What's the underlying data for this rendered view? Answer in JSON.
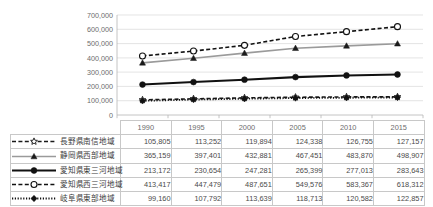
{
  "chart_data": {
    "type": "line",
    "title": "",
    "subtitle": "",
    "xlabel": "",
    "ylabel": "",
    "categories": [
      "1990",
      "1995",
      "2000",
      "2005",
      "2010",
      "2015"
    ],
    "ylim": [
      0,
      700000
    ],
    "yticks": [
      0,
      100000,
      200000,
      300000,
      400000,
      500000,
      600000,
      700000
    ],
    "ytick_labels": [
      "0",
      "100,000",
      "200,000",
      "300,000",
      "400,000",
      "500,000",
      "600,000",
      "700,000"
    ],
    "grid": "horizontal",
    "legend_position": "table-left",
    "series": [
      {
        "name": "長野県南信地域",
        "marker": "open-star",
        "line_style": "dashed",
        "color": "#1a1a1a",
        "values": [
          105805,
          113252,
          119894,
          124338,
          126755,
          127157
        ],
        "display_values": [
          "105,805",
          "113,252",
          "119,894",
          "124,338",
          "126,755",
          "127,157"
        ]
      },
      {
        "name": "静岡県西部地域",
        "marker": "filled-triangle",
        "line_style": "solid",
        "color": "#9a9a9a",
        "values": [
          365159,
          397401,
          432881,
          467451,
          483870,
          498907
        ],
        "display_values": [
          "365,159",
          "397,401",
          "432,881",
          "467,451",
          "483,870",
          "498,907"
        ]
      },
      {
        "name": "愛知県東三河地域",
        "marker": "filled-circle",
        "line_style": "solid",
        "color": "#111111",
        "values": [
          213172,
          230654,
          247281,
          265399,
          277013,
          283643
        ],
        "display_values": [
          "213,172",
          "230,654",
          "247,281",
          "265,399",
          "277,013",
          "283,643"
        ]
      },
      {
        "name": "愛知県西三河地域",
        "marker": "open-circle",
        "line_style": "dashed",
        "color": "#111111",
        "values": [
          413417,
          447479,
          487651,
          549576,
          583367,
          618312
        ],
        "display_values": [
          "413,417",
          "447,479",
          "487,651",
          "549,576",
          "583,367",
          "618,312"
        ]
      },
      {
        "name": "岐阜県東部地域",
        "marker": "filled-diamond",
        "line_style": "dotted",
        "color": "#111111",
        "values": [
          99160,
          107792,
          113639,
          118713,
          120582,
          122857
        ],
        "display_values": [
          "99,160",
          "107,792",
          "113,639",
          "118,713",
          "120,582",
          "122,857"
        ]
      }
    ]
  },
  "table": {
    "header_corner": "",
    "year_headers": [
      "1990",
      "1995",
      "2000",
      "2005",
      "2010",
      "2015"
    ],
    "rows": [
      {
        "label": "長野県南信地域",
        "values": [
          "105,805",
          "113,252",
          "119,894",
          "124,338",
          "126,755",
          "127,157"
        ]
      },
      {
        "label": "静岡県西部地域",
        "values": [
          "365,159",
          "397,401",
          "432,881",
          "467,451",
          "483,870",
          "498,907"
        ]
      },
      {
        "label": "愛知県東三河地域",
        "values": [
          "213,172",
          "230,654",
          "247,281",
          "265,399",
          "277,013",
          "283,643"
        ]
      },
      {
        "label": "愛知県西三河地域",
        "values": [
          "413,417",
          "447,479",
          "487,651",
          "549,576",
          "583,367",
          "618,312"
        ]
      },
      {
        "label": "岐阜県東部地域",
        "values": [
          "99,160",
          "107,792",
          "113,639",
          "118,713",
          "120,582",
          "122,857"
        ]
      }
    ]
  },
  "axis": {
    "y_labels": [
      "700,000",
      "600,000",
      "500,000",
      "400,000",
      "300,000",
      "200,000",
      "100,000",
      "0"
    ]
  },
  "colors": {
    "gridline": "#d9d9d9",
    "axis": "#b5b5b5",
    "table_border": "#c8c8c8",
    "text": "#4a4a4a",
    "tick_text": "#6d6d6d",
    "series_gray": "#9a9a9a",
    "series_black": "#111111"
  }
}
